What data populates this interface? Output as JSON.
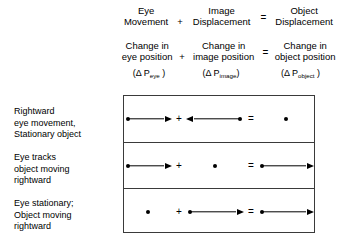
{
  "equation_header": {
    "line_1": {
      "terms": [
        {
          "lines": [
            "Eye",
            "Movement"
          ]
        },
        {
          "lines": [
            "Image",
            "Displacement"
          ]
        },
        {
          "lines": [
            "Object",
            "Displacement"
          ]
        }
      ],
      "operator_plus": "+",
      "operator_equals": "="
    },
    "line_2": {
      "terms": [
        {
          "lines": [
            "Change in",
            "eye position"
          ]
        },
        {
          "lines": [
            "Change in",
            "image position"
          ]
        },
        {
          "lines": [
            "Change in",
            "object position"
          ]
        }
      ],
      "operator_plus": "+",
      "operator_equals": "="
    },
    "symbols": [
      {
        "open": "(",
        "delta": "Δ",
        "base": " P",
        "sub": "eye",
        "close": " )"
      },
      {
        "open": "(",
        "delta": "Δ",
        "base": " P",
        "sub": "image",
        "close": ")"
      },
      {
        "open": "(",
        "delta": "Δ",
        "base": " P",
        "sub": "object",
        "close": " )"
      }
    ]
  },
  "matrix": {
    "row_labels": [
      {
        "lines": [
          "Rightward",
          "eye movement,",
          "Stationary object"
        ]
      },
      {
        "lines": [
          "Eye tracks",
          "object moving",
          "rightward"
        ]
      },
      {
        "lines": [
          "Eye stationary;",
          "Object moving",
          "rightward"
        ]
      }
    ],
    "operators": {
      "plus": "+",
      "equals": "="
    },
    "rows": [
      {
        "name": "rightward-eye-movement-stationary-object",
        "eye_movement": "arrow-right",
        "image_displacement": "arrow-left",
        "object_displacement": "dot"
      },
      {
        "name": "eye-tracks-object-moving-rightward",
        "eye_movement": "arrow-right",
        "image_displacement": "dot",
        "object_displacement": "arrow-right"
      },
      {
        "name": "eye-stationary-object-moving-rightward",
        "eye_movement": "dot",
        "image_displacement": "arrow-right",
        "object_displacement": "arrow-right"
      }
    ]
  },
  "colors": {
    "ink": "#000000",
    "border": "#3a3a3a",
    "background": "#ffffff"
  }
}
